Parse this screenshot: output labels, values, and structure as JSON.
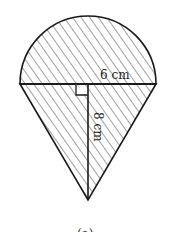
{
  "figure": {
    "radius_label": "6 cm",
    "height_label": "8 cm",
    "caption": "(a)",
    "stroke_color": "#1a1a1a",
    "hatch_color": "#444444"
  }
}
